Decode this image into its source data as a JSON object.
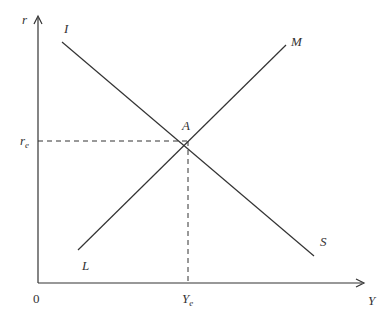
{
  "diagram": {
    "type": "IS-LM",
    "axes": {
      "y_label": "r",
      "x_label": "Y",
      "origin_label": "0"
    },
    "curves": [
      {
        "name": "IS",
        "start_label": "I",
        "end_label": "S",
        "slope": "downward"
      },
      {
        "name": "LM",
        "start_label": "L",
        "end_label": "M",
        "slope": "upward"
      }
    ],
    "equilibrium": {
      "point_label": "A",
      "r_label": "r",
      "r_sub": "e",
      "y_label": "Y",
      "y_sub": "e"
    },
    "colors": {
      "line": "#333333",
      "background": "#ffffff"
    }
  }
}
